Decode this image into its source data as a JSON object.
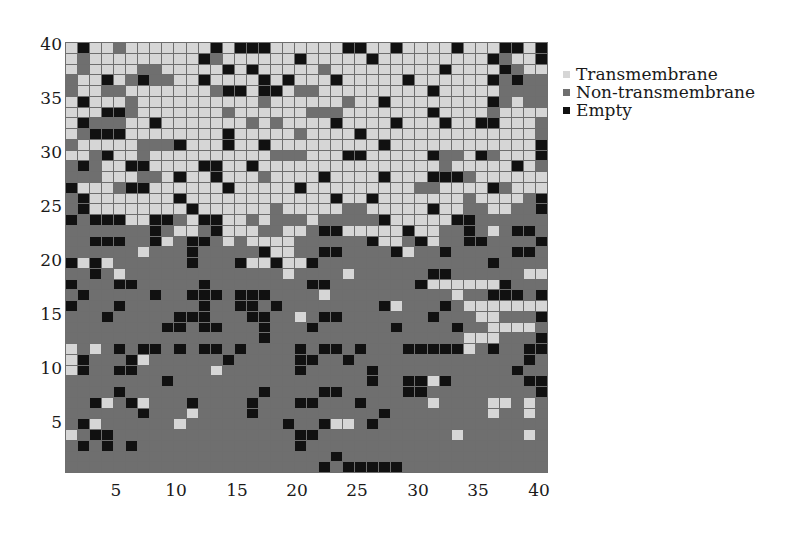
{
  "chart_data": {
    "type": "heatmap",
    "title": "",
    "xlabel": "",
    "ylabel": "",
    "x_range": [
      1,
      40
    ],
    "y_range": [
      1,
      40
    ],
    "x_ticks": [
      "5",
      "10",
      "15",
      "20",
      "25",
      "30",
      "35",
      "40"
    ],
    "y_ticks": [
      "40",
      "35",
      "30",
      "25",
      "20",
      "15",
      "10",
      "5"
    ],
    "grid": true,
    "legend_position": "right-top",
    "legend": [
      {
        "key": "T",
        "label": "Transmembrane",
        "color": "#d6d6d6"
      },
      {
        "key": "N",
        "label": "Non-transmembrane",
        "color": "#6f6f6f"
      },
      {
        "key": "E",
        "label": "Empty",
        "color": "#111111"
      }
    ],
    "rows_top_to_bottom": [
      "TETTNTTTTTTTETEEETTTTTTEETTETTTTETTTEETE",
      "TNTTTTTTTTTENTTTTTTETTTTTETTTTTTTTTENTTE",
      "TNTTTTNNTTTTTETETTTTTNTTTTTTTTTETTTTENTT",
      "NTTETNENNTTETTTTETETTTETTTTTETTTTTTENENN",
      "NTTNNTTTTTTTNEETEETNNTTTTTTTTTETTTTTNNNN",
      "TETTTNTTTTTTTTTTNTTTTTTNTTETTTTTTTTENTNN",
      "TTTEENTTTTTTTNTTTTTTNNNTTTTTTTETTTTNTTTT",
      "TENNNTTETTTTTTTNTNTTTTETTTTETTTETTEETTTN",
      "TNEEETTTTTTTTETTTTTNTTTTETTTTTTTTTTTTTTN",
      "NTTTTTNNNETTTETTETTTTTTTTTETTTTTTTTTTTTE",
      "TTNETTNTTTTTTTTTTNNNTTTEETTTTTENNTENTTTE",
      "NENTTEETTTTEETTETTTTTTTTTTTTTTTNTTTTTETN",
      "NNNTTTNNTETTETTTNTTTTETTTTETTTEEENTTTTTT",
      "ETTTNEETTTTTTETTTTTETTTTTTTTTNNTTTTENTTT",
      "NETTTTTTTETTTTTTTTTTTTETTETTTTTTTNTTTTNE",
      "NETTTTTTTTETTTTTTNTTTTTNNTTTTTETTNNTTNNE",
      "ENEEETTEENTEETTNTNNNTNNNNNETTTTTEENNNNNN",
      "NNNNNNNENTTNETTTNNTTNEETTTTTETTNNENTNEE",
      "NNEEENNETNEENTNTTTTNNNNNNETTNETNNEENNNNE",
      "NNNNNNTNNNENNNNNETTNNEENNNNETNNENNNNNEEN",
      "ETETNNNNNNENNNETTETTENNNNNNNNNNNNNNENNNN",
      "NNENTNNNNNNNNNNNNNTNNNNTNNNNNNEENNNNNNTT",
      "ENNNEENNNNNENNNNNNNNEENNNNNNNETTTTTTENNN",
      "NENNNNNENNEEENEEENNNNTNNNNNNNNNNTNNEEENE",
      "ENNNENNNNNNENNEENENNNNNNNNETNNNENTTTTTTT",
      "NNNENNNNNEEENNNEENNTNEENNNNNNNENNNTTNNNE",
      "NNNNNNNNEENEENNNENNNENNNNNNENNNNENNTTTTN",
      "NNNNNNNNNNNNNNNNENNNNNNNNNNNNNNNNTTTNNNE",
      "TNTNENEENENEENENNNNENEENENNNEEEEETNENNEE",
      "TENNNETNNNNNNENNNNNEENNENNNNNNNNNNNNNNEN",
      "TENNEENNNNNNTNNNNNNENNNNNENNNNNNNNNNNENN",
      "NNNNNNNNENNNNNNNNNNNNNNNNENNEETENNNNNNEE",
      "NNNNENNNNNNNNNNNENNNNEENNNNNEENNNNNNNNNE",
      "NNETNETNNNENNNNENNNEENNNENNNNNTNNNNTTNTN",
      "NNNNNNENNNTNNNNENNNNNNNNNNENNNNNNNNTNNTN",
      "NETNNNNNNTNNNNNNNNENNETTNENNNNNNNNNNNNNN",
      "TNEENNNNNNNNNNNNNNNEENNNNNNNNNNNTNNNNNTN",
      "NENENENNNNNNNNNNNNNENNNNNNNNNNNNNNNNNNNN",
      "NNNNNNNNNNNNNNNNNNNNNNENNNNNNNNNNNNNNNNN",
      "NNNNNNNNNNNNNNNNNNNNNENEEEEENNNNNNNNNNNN"
    ]
  }
}
